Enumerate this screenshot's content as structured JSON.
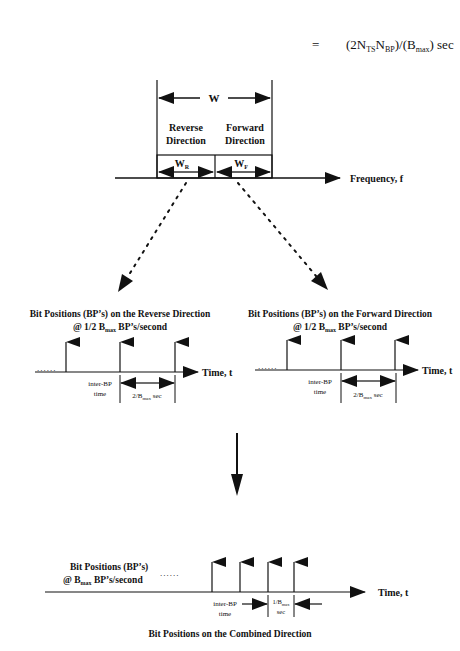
{
  "formula": {
    "equals": "=",
    "text_pre": "(2N",
    "sub1": "TS",
    "mid": "N",
    "sub2": "BP",
    "text_post1": ")/(B",
    "sub3": "max",
    "text_post2": ") sec"
  },
  "band": {
    "w_label": "W",
    "reverse_line1": "Reverse",
    "reverse_line2": "Direction",
    "forward_line1": "Forward",
    "forward_line2": "Direction",
    "wr_main": "W",
    "wr_sub": "R",
    "wf_main": "W",
    "wf_sub": "F",
    "freq_axis_label": "Frequency, f"
  },
  "reverse_panel": {
    "title": "Bit Positions (BP’s) on the Reverse Direction",
    "rate_pre": "@ 1/2 B",
    "rate_sub": "max",
    "rate_post": " BP’s/second",
    "dots": "......",
    "axis_label": "Time, t",
    "inter_bp_line1": "inter-BP",
    "inter_bp_line2": "time",
    "spacing_pre": "2/B",
    "spacing_sub": "max",
    "spacing_post": " sec"
  },
  "forward_panel": {
    "title": "Bit Positions (BP’s) on the Forward Direction",
    "rate_pre": "@ 1/2 B",
    "rate_sub": "max",
    "rate_post": " BP’s/second",
    "dots": "......",
    "axis_label": "Time, t",
    "inter_bp_line1": "inter-BP",
    "inter_bp_line2": "time",
    "spacing_pre": "2/B",
    "spacing_sub": "max",
    "spacing_post": " sec"
  },
  "combined_panel": {
    "title_line1": "Bit Positions (BP’s)",
    "rate_pre": "@ B",
    "rate_sub": "max",
    "rate_post": " BP’s/second",
    "dots": "......",
    "axis_label": "Time, t",
    "inter_bp_line1": "inter-BP",
    "inter_bp_line2": "time",
    "spacing_pre": "1/B",
    "spacing_sub": "max",
    "spacing_line2": "sec",
    "caption": "Bit Positions on the Combined Direction"
  }
}
